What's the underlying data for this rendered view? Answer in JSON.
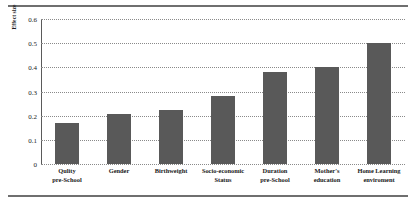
{
  "chart_data": {
    "type": "bar",
    "title": "",
    "xlabel": "",
    "ylabel": "Effect size",
    "ylim": [
      0,
      0.6
    ],
    "ytick_labels": [
      "0",
      "0.1",
      "0.2",
      "0.3",
      "0.4",
      "0.5",
      "0.6"
    ],
    "ytick_values": [
      0,
      0.1,
      0.2,
      0.3,
      0.4,
      0.5,
      0.6
    ],
    "grid": true,
    "legend": "none",
    "bar_color": "#595959",
    "categories": [
      "Qulity pre-School",
      "Gender",
      "Birthweight",
      "Socio-economic Status",
      "Duration pre-School",
      "Mother's education",
      "Home Learning enviroment"
    ],
    "category_lines": [
      [
        "Qulity",
        "pre-School"
      ],
      [
        "Gender",
        ""
      ],
      [
        "Birthweight",
        ""
      ],
      [
        "Socio-economic",
        "Status"
      ],
      [
        "Duration",
        "pre-School"
      ],
      [
        "Mother's",
        "education"
      ],
      [
        "Home Learning",
        "enviroment"
      ]
    ],
    "values": [
      0.17,
      0.205,
      0.225,
      0.28,
      0.38,
      0.4,
      0.5
    ]
  }
}
